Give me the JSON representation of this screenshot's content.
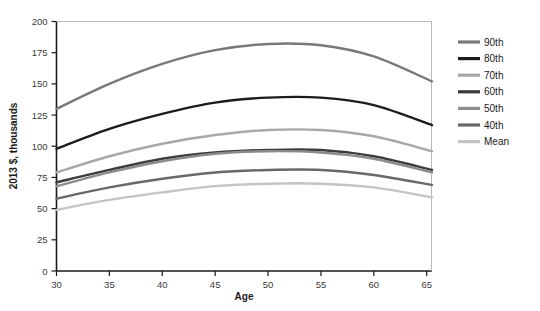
{
  "chart_data": {
    "type": "line",
    "title": "",
    "xlabel": "Age",
    "ylabel": "2013 $, thousands",
    "xlim": [
      30,
      65.5
    ],
    "ylim": [
      0,
      200
    ],
    "xticks": [
      30,
      35,
      40,
      45,
      50,
      55,
      60,
      65
    ],
    "yticks": [
      0,
      25,
      50,
      75,
      100,
      125,
      150,
      175,
      200
    ],
    "grid": false,
    "legend_position": "right",
    "x": [
      30,
      35,
      40,
      45,
      50,
      55,
      60,
      65.5
    ],
    "series": [
      {
        "name": "90th",
        "color": "#787878",
        "width": 2.4,
        "values": [
          130,
          150,
          166,
          177,
          182,
          181,
          172,
          152
        ]
      },
      {
        "name": "80th",
        "color": "#1c1c1c",
        "width": 2.4,
        "values": [
          98,
          114,
          126,
          135,
          139,
          139,
          133,
          117
        ]
      },
      {
        "name": "70th",
        "color": "#a8a8a8",
        "width": 2.4,
        "values": [
          79,
          92,
          102,
          109,
          113,
          113,
          108,
          96
        ]
      },
      {
        "name": "60th",
        "color": "#3c3c3c",
        "width": 2.4,
        "values": [
          71,
          81,
          90,
          95,
          97,
          97,
          92,
          81
        ]
      },
      {
        "name": "50th",
        "color": "#8c8c8c",
        "width": 2.4,
        "values": [
          68,
          79,
          88,
          94,
          96,
          95,
          90,
          79
        ]
      },
      {
        "name": "40th",
        "color": "#696969",
        "width": 2.4,
        "values": [
          58,
          67,
          74,
          79,
          81,
          81,
          77,
          69
        ]
      },
      {
        "name": "Mean",
        "color": "#c4c4c4",
        "width": 2.4,
        "values": [
          49,
          57,
          63,
          68,
          70,
          70,
          67,
          59
        ]
      }
    ]
  },
  "axes": {
    "x_label": "Age",
    "y_label": "2013 $, thousands",
    "x_tick_labels": [
      "30",
      "35",
      "40",
      "45",
      "50",
      "55",
      "60",
      "65"
    ],
    "y_tick_labels": [
      "0",
      "25",
      "50",
      "75",
      "100",
      "125",
      "150",
      "175",
      "200"
    ]
  },
  "legend": {
    "items": [
      {
        "label": "90th",
        "color": "#787878"
      },
      {
        "label": "80th",
        "color": "#1c1c1c"
      },
      {
        "label": "70th",
        "color": "#a8a8a8"
      },
      {
        "label": "60th",
        "color": "#3c3c3c"
      },
      {
        "label": "50th",
        "color": "#8c8c8c"
      },
      {
        "label": "40th",
        "color": "#696969"
      },
      {
        "label": "Mean",
        "color": "#c4c4c4"
      }
    ]
  },
  "colors": {
    "axis": "#1a1a1a",
    "background": "#ffffff",
    "tick_text": "#3a3a3a"
  }
}
